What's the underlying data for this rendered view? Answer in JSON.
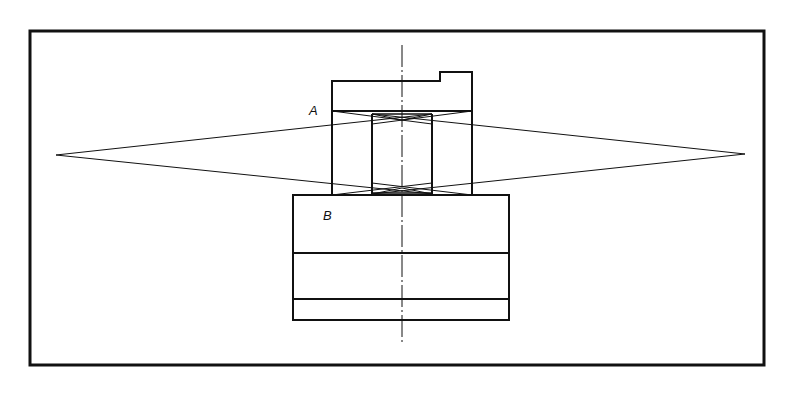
{
  "diagram": {
    "type": "technical-drawing",
    "labels": {
      "A": "A",
      "B": "B"
    },
    "colors": {
      "stroke": "#111111",
      "background": "#ffffff"
    }
  }
}
